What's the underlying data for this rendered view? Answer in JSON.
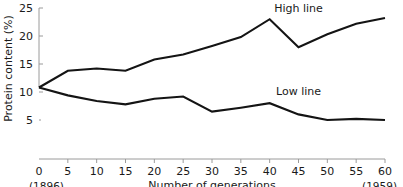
{
  "chart_data": {
    "type": "line",
    "title": "",
    "xlabel": "Number of generations",
    "ylabel": "Protein content (%)",
    "x": [
      0,
      5,
      10,
      15,
      20,
      25,
      30,
      35,
      40,
      45,
      50,
      55,
      60
    ],
    "xlim": [
      0,
      60
    ],
    "ylim": [
      5,
      25
    ],
    "xticks": [
      0,
      5,
      10,
      15,
      20,
      25,
      30,
      35,
      40,
      45,
      50,
      55,
      60
    ],
    "xtick_labels": [
      "0",
      "5",
      "10",
      "15",
      "20",
      "25",
      "30",
      "35",
      "40",
      "45",
      "50",
      "55",
      "60"
    ],
    "yticks": [
      5,
      10,
      15,
      20,
      25
    ],
    "ytick_labels": [
      "5",
      "10",
      "15",
      "20",
      "25"
    ],
    "grid": false,
    "legend_position": "inline-annotation",
    "x_start_annotation": "(1896)",
    "x_end_annotation": "(1959)",
    "series": [
      {
        "name": "High line",
        "color": "#141414",
        "values": [
          10.8,
          13.8,
          14.2,
          13.8,
          15.8,
          16.7,
          18.2,
          19.8,
          23.0,
          18.0,
          20.3,
          22.2,
          23.2
        ]
      },
      {
        "name": "Low line",
        "color": "#141414",
        "values": [
          10.8,
          9.4,
          8.4,
          7.8,
          8.8,
          9.2,
          6.5,
          7.2,
          8.0,
          6.0,
          5.0,
          5.2,
          5.0
        ]
      }
    ],
    "annotations": [
      {
        "text": "High line",
        "x": 45,
        "y": 24.3
      },
      {
        "text": "Low line",
        "x": 45,
        "y": 9.4
      }
    ]
  }
}
